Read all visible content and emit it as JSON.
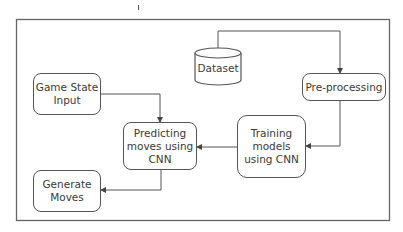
{
  "diagram": {
    "nodes": {
      "dataset": {
        "label": "Dataset",
        "shape": "cylinder"
      },
      "preprocessing": {
        "label": "Pre-processing",
        "shape": "rounded-rect"
      },
      "game_state_input": {
        "label": "Game State\nInput",
        "shape": "rounded-rect"
      },
      "predicting": {
        "label": "Predicting\nmoves using\nCNN",
        "shape": "rounded-rect"
      },
      "training": {
        "label": "Training\nmodels\nusing CNN",
        "shape": "rounded-rect"
      },
      "generate_moves": {
        "label": "Generate\nMoves",
        "shape": "rounded-rect"
      }
    },
    "edges": [
      {
        "from": "dataset",
        "to": "preprocessing"
      },
      {
        "from": "preprocessing",
        "to": "training"
      },
      {
        "from": "training",
        "to": "predicting"
      },
      {
        "from": "game_state_input",
        "to": "predicting"
      },
      {
        "from": "predicting",
        "to": "generate_moves"
      }
    ],
    "colors": {
      "stroke": "#555555",
      "text": "#3a3a3a",
      "background": "#ffffff"
    }
  }
}
